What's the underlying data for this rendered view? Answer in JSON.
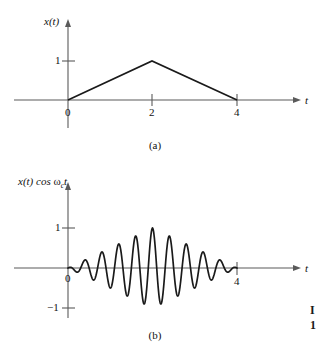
{
  "figure": {
    "background_color": "#ffffff",
    "axis_color": "#4d4d4d",
    "curve_color": "#1a1a1a",
    "panels": [
      {
        "id": "panel-a",
        "caption": "(a)",
        "y_axis_label": "x(t)",
        "x_axis_label": "t",
        "y_ticks": [
          {
            "value": 1,
            "label": "1"
          }
        ],
        "x_ticks": [
          {
            "value": 0,
            "label": "0"
          },
          {
            "value": 2,
            "label": "2"
          },
          {
            "value": 4,
            "label": "4"
          }
        ]
      },
      {
        "id": "panel-b",
        "caption": "(b)",
        "y_axis_label_prefix": "x(t) cos ",
        "y_axis_label_omega": "ω",
        "y_axis_label_subscript": "c",
        "y_axis_label_suffix": "t",
        "y_axis_label_plain": "x(t) cos ωc t",
        "x_axis_label": "t",
        "y_ticks": [
          {
            "value": 1,
            "label": "1"
          },
          {
            "value": -1,
            "label": "−1"
          }
        ],
        "x_ticks": [
          {
            "value": 0,
            "label": "0"
          },
          {
            "value": 4,
            "label": "4"
          }
        ]
      }
    ]
  },
  "chart_data": [
    {
      "type": "line",
      "id": "panel-a",
      "title": "(a)",
      "xlabel": "t",
      "ylabel": "x(t)",
      "xlim": [
        -0.4,
        5.5
      ],
      "ylim": [
        -0.45,
        1.45
      ],
      "grid": false,
      "legend": "none",
      "description": "Triangular pulse x(t): rises linearly from 0 at t=0 to 1 at t=2, then falls linearly back to 0 at t=4.",
      "x": [
        0,
        2,
        4
      ],
      "y": [
        0,
        1,
        0
      ],
      "xticks": [
        0,
        2,
        4
      ],
      "yticks": [
        1
      ]
    },
    {
      "type": "line",
      "id": "panel-b",
      "title": "(b)",
      "xlabel": "t",
      "ylabel": "x(t) cos ωc t",
      "xlim": [
        -0.4,
        5.5
      ],
      "ylim": [
        -1.45,
        1.45
      ],
      "grid": false,
      "legend": "none",
      "description": "Amplitude-modulated signal: triangular envelope x(t) from t=0 to t=4 multiplied by the carrier cos(ωc t); about 10 oscillation cycles, peak magnitude 1 near t=2, envelope zero at t=0 and t=4.",
      "envelope_peak": 1,
      "envelope_peak_time": 2,
      "carrier_cycles": 10,
      "xticks": [
        0,
        4
      ],
      "yticks": [
        1,
        -1
      ]
    }
  ],
  "edge_artifact": {
    "line1": "I",
    "line2": "1"
  }
}
